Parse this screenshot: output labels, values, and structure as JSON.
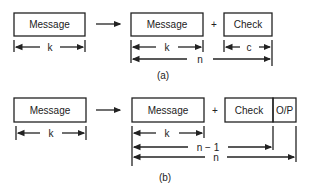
{
  "diagram_a": {
    "input_label": "Message",
    "output_message_label": "Message",
    "plus": "+",
    "check_label": "Check",
    "dim_k_input": "k",
    "dim_k_output": "k",
    "dim_c": "c",
    "dim_n": "n",
    "caption": "(a)"
  },
  "diagram_b": {
    "input_label": "Message",
    "output_message_label": "Message",
    "plus": "+",
    "check_label": "Check",
    "parity_label": "O/P",
    "dim_k_input": "k",
    "dim_k_output": "k",
    "dim_n_minus_1": "n − 1",
    "dim_n": "n",
    "caption": "(b)"
  }
}
